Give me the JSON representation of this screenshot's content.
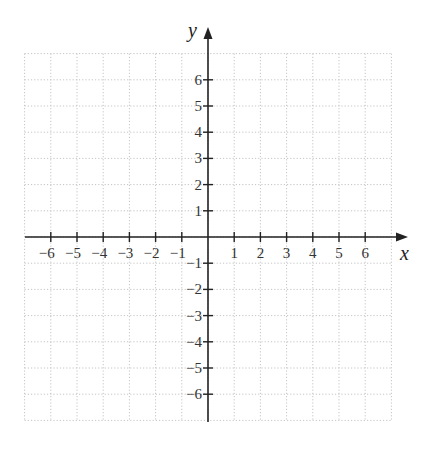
{
  "chart_data": {
    "type": "scatter",
    "title": "",
    "xlabel": "x",
    "ylabel": "y",
    "xlim": [
      -7,
      7
    ],
    "ylim": [
      -7,
      7
    ],
    "grid": true,
    "grid_style": "dotted",
    "x_ticks": [
      -6,
      -5,
      -4,
      -3,
      -2,
      -1,
      1,
      2,
      3,
      4,
      5,
      6
    ],
    "y_ticks": [
      -6,
      -5,
      -4,
      -3,
      -2,
      -1,
      1,
      2,
      3,
      4,
      5,
      6
    ],
    "x_tick_labels": [
      "−6",
      "−5",
      "−4",
      "−3",
      "−2",
      "−1",
      "1",
      "2",
      "3",
      "4",
      "5",
      "6"
    ],
    "y_tick_labels": [
      "−6",
      "−5",
      "−4",
      "−3",
      "−2",
      "−1",
      "1",
      "2",
      "3",
      "4",
      "5",
      "6"
    ],
    "series": [],
    "legend": null
  },
  "layout": {
    "origin": [
      208,
      237
    ],
    "unit": 26.2,
    "grid_min": -7,
    "grid_max": 7,
    "x_axis_end_px": 408,
    "y_axis_top_px": 27,
    "x_axis_start_px": 25,
    "y_axis_bottom_px": 422
  },
  "colors": {
    "grid": "#c4c4c4",
    "axis": "#222222",
    "label": "#333333"
  }
}
